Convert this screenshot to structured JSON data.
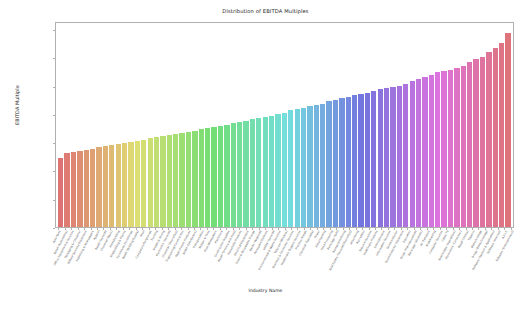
{
  "chart_data": {
    "type": "bar",
    "title": "Distribution of EBITDA Multiples",
    "xlabel": "Industry Name",
    "ylabel": "EBITDA Multiple",
    "ylim": [
      0.0,
      18.2
    ],
    "yticks": [
      "0.0",
      "2.5",
      "5.0",
      "7.5",
      "10.0",
      "12.5",
      "15.0",
      "17.5"
    ],
    "ytick_values": [
      0.0,
      2.5,
      5.0,
      7.5,
      10.0,
      12.5,
      15.0,
      17.5
    ],
    "grid": false,
    "legend": null,
    "sorted": "ascending",
    "palette": "husl-hue-cycle",
    "categories": [
      "Auto Parts",
      "Retail (Automotive)",
      "Office Equipment & Services",
      "Packaging & Container",
      "Oilfield Services/Equipment",
      "Publishing & Newspapers",
      "Apparel",
      "Retail (General)",
      "Chemical (Basic)",
      "Homebuilding",
      "Shipbuilding & Marine",
      "Furn/Home Furnishings",
      "Retail (Building Supply)",
      "Steel",
      "Computers/Peripherals",
      "Trucking",
      "Metals & Mining",
      "Electronics (General)",
      "Chemical (Diversified)",
      "Engineering/Construction",
      "Paper/Forest Products",
      "Retail (Distributors)",
      "Transportation",
      "Rubber & Tires",
      "Food Wholesalers",
      "Machinery",
      "Construction Supplies",
      "Retail (Grocery and Food)",
      "Household Products",
      "Electrical Equipment",
      "Green & Renewable Energy",
      "Banks (Regional)",
      "Aerospace/Defense",
      "Utility (General)",
      "Environmental & Waste Services",
      "Telecom (Wireless)",
      "Business & Consumer Services",
      "Healthcare Support Services",
      "Precious Metals",
      "Chemical (Specialty)",
      "Power",
      "Hotel/Gaming",
      "Food Processing",
      "Beverage (Soft)",
      "Restaurant/Dining",
      "Real Estate (General/Diversified)",
      "Advertising",
      "Recreation",
      "Telecom Services",
      "Healthcare Products",
      "Entertainment",
      "Information Services",
      "Semiconductor",
      "Semiconductor Equipment",
      "Education",
      "Drugs (Pharmaceutical)",
      "Beverage (Alcoholic)",
      "Air Transport",
      "Broadcasting",
      "Computer Services",
      "Cable TV",
      "Real Estate (Operations)",
      "Electronics (Consumer)",
      "Retail (Online)",
      "Tobacco",
      "Biotechnology",
      "Drugs (Biotechnology)",
      "Software (System & Application)",
      "Software (Internet)",
      "R.E.I.T.",
      "Software (Entertainment)"
    ],
    "values": [
      6.2,
      6.6,
      6.7,
      6.8,
      6.9,
      7.0,
      7.1,
      7.2,
      7.3,
      7.4,
      7.5,
      7.6,
      7.7,
      7.8,
      7.9,
      8.0,
      8.1,
      8.2,
      8.3,
      8.4,
      8.5,
      8.6,
      8.7,
      8.8,
      8.9,
      9.0,
      9.1,
      9.3,
      9.4,
      9.5,
      9.6,
      9.7,
      9.8,
      9.9,
      10.1,
      10.2,
      10.4,
      10.5,
      10.6,
      10.8,
      10.9,
      11.0,
      11.2,
      11.3,
      11.5,
      11.6,
      11.8,
      11.9,
      12.0,
      12.1,
      12.3,
      12.4,
      12.5,
      12.6,
      12.8,
      13.0,
      13.2,
      13.4,
      13.6,
      13.8,
      13.9,
      14.0,
      14.2,
      14.4,
      14.7,
      15.0,
      15.2,
      15.6,
      16.0,
      16.4,
      17.3
    ]
  }
}
